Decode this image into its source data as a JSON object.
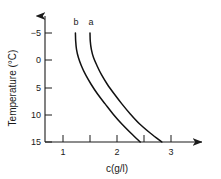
{
  "chart_data": {
    "type": "line",
    "title": "",
    "xlabel": "c(g/l)",
    "ylabel": "Temperature (°C)",
    "xlim": [
      0.66,
      3.55
    ],
    "ylim": [
      -7.0,
      15.0
    ],
    "y_axis_inverted": true,
    "grid": false,
    "legend": "inline-curve-labels",
    "xticks": [
      1,
      2,
      3
    ],
    "xtick_labels": [
      "1",
      "2",
      "3"
    ],
    "x_minor_ticks": [
      1.5,
      2.5
    ],
    "yticks": [
      -5,
      0,
      5,
      10,
      15
    ],
    "ytick_labels": [
      "−5",
      "0",
      "5",
      "10",
      "15"
    ],
    "series": [
      {
        "name": "b",
        "label": "b",
        "x": [
          1.23,
          1.235,
          1.25,
          1.285,
          1.34,
          1.42,
          1.52,
          1.64,
          1.78,
          1.93,
          2.09,
          2.26,
          2.43
        ],
        "y": [
          -5.0,
          -3.5,
          -2.0,
          -0.5,
          1.0,
          2.7,
          4.4,
          6.2,
          8.0,
          9.9,
          11.7,
          13.4,
          15.0
        ]
      },
      {
        "name": "a",
        "label": "a",
        "x": [
          1.5,
          1.505,
          1.525,
          1.565,
          1.63,
          1.715,
          1.82,
          1.95,
          2.09,
          2.25,
          2.42,
          2.62,
          2.83
        ],
        "y": [
          -5.0,
          -3.5,
          -2.0,
          -0.5,
          1.0,
          2.7,
          4.4,
          6.2,
          8.0,
          9.9,
          11.7,
          13.4,
          15.0
        ]
      }
    ],
    "series_labels": [
      {
        "text": "b",
        "x": 1.24,
        "y": -6.4
      },
      {
        "text": "a",
        "x": 1.52,
        "y": -6.4
      }
    ],
    "colors": {
      "curve": "#111111",
      "axis": "#1a1a1a",
      "background": "#ffffff"
    }
  }
}
